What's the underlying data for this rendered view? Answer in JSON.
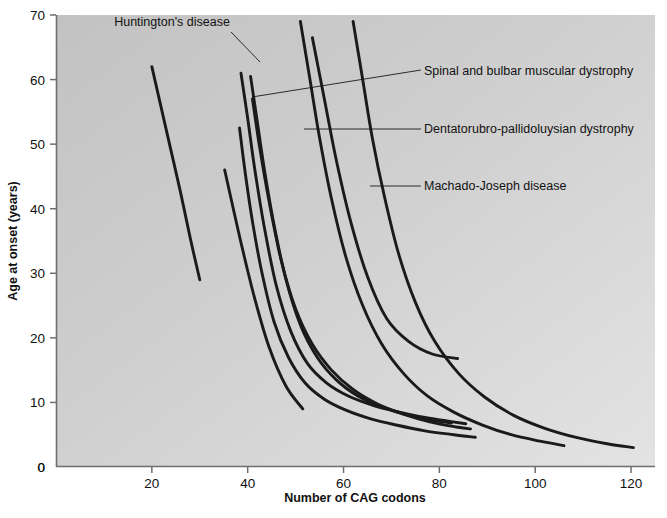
{
  "chart_data": {
    "type": "line",
    "title": "",
    "xlabel": "Number of CAG codons",
    "ylabel": "Age at onset (years)",
    "xlim": [
      0,
      125
    ],
    "ylim": [
      0,
      70
    ],
    "xticks": [
      20,
      40,
      60,
      80,
      100,
      120
    ],
    "yticks": [
      0,
      10,
      20,
      30,
      40,
      50,
      60,
      70
    ],
    "x_origin_label": "0",
    "grid": false,
    "legend_position": "annotations-inline",
    "background": "#c8c8c8",
    "line_color": "#1a1a1a",
    "annotations": [
      {
        "label": "Huntington's disease",
        "label_x": 172,
        "label_y": 26,
        "leader": [
          [
            231,
            32
          ],
          [
            260,
            62
          ]
        ]
      },
      {
        "label": "Spinal and bulbar muscular dystrophy",
        "label_x": 424,
        "label_y": 75,
        "leader": [
          [
            421,
            70
          ],
          [
            252,
            97
          ]
        ]
      },
      {
        "label": "Dentatorubro-pallidoluysian dystrophy",
        "label_x": 424,
        "label_y": 133,
        "leader": [
          [
            421,
            129
          ],
          [
            304,
            129
          ]
        ]
      },
      {
        "label": "Machado-Joseph disease",
        "label_x": 424,
        "label_y": 190,
        "leader": [
          [
            421,
            186
          ],
          [
            370,
            186
          ]
        ]
      }
    ],
    "series": [
      {
        "name": "curve-1",
        "points": [
          [
            20.0,
            62.0
          ],
          [
            22.0,
            55.5
          ],
          [
            24.0,
            49.0
          ],
          [
            26.0,
            42.5
          ],
          [
            28.0,
            35.5
          ],
          [
            30.0,
            29.0
          ]
        ]
      },
      {
        "name": "curve-2",
        "points": [
          [
            35.2,
            46.0
          ],
          [
            37.0,
            40.0
          ],
          [
            39.0,
            33.5
          ],
          [
            41.5,
            26.0
          ],
          [
            44.5,
            18.5
          ],
          [
            48.0,
            12.5
          ],
          [
            51.5,
            9.0
          ]
        ]
      },
      {
        "name": "curve-3",
        "points": [
          [
            38.6,
            61.0
          ],
          [
            40.0,
            54.0
          ],
          [
            41.5,
            46.0
          ],
          [
            43.5,
            37.0
          ],
          [
            46.0,
            28.0
          ],
          [
            49.0,
            21.0
          ],
          [
            52.5,
            16.0
          ],
          [
            56.5,
            13.0
          ],
          [
            61.0,
            11.0
          ],
          [
            66.0,
            9.6
          ],
          [
            71.0,
            8.6
          ],
          [
            76.0,
            7.8
          ],
          [
            81.0,
            7.2
          ],
          [
            85.5,
            6.7
          ]
        ]
      },
      {
        "name": "curve-4",
        "points": [
          [
            38.3,
            52.5
          ],
          [
            39.5,
            45.5
          ],
          [
            41.0,
            38.0
          ],
          [
            43.0,
            30.0
          ],
          [
            45.5,
            22.5
          ],
          [
            48.5,
            17.0
          ],
          [
            52.0,
            13.0
          ],
          [
            56.0,
            10.5
          ],
          [
            60.5,
            8.8
          ],
          [
            65.5,
            7.5
          ],
          [
            71.0,
            6.5
          ],
          [
            77.0,
            5.6
          ],
          [
            83.0,
            5.0
          ],
          [
            87.5,
            4.6
          ]
        ]
      },
      {
        "name": "curve-5",
        "points": [
          [
            40.6,
            60.5
          ],
          [
            42.0,
            53.5
          ],
          [
            43.5,
            46.0
          ],
          [
            45.5,
            37.5
          ],
          [
            48.0,
            29.0
          ],
          [
            51.0,
            22.0
          ],
          [
            54.5,
            17.0
          ],
          [
            58.5,
            13.5
          ],
          [
            63.0,
            11.0
          ],
          [
            68.0,
            9.3
          ],
          [
            73.5,
            8.0
          ],
          [
            79.0,
            7.2
          ],
          [
            82.5,
            6.8
          ]
        ]
      },
      {
        "name": "curve-6",
        "points": [
          [
            41.0,
            57.0
          ],
          [
            42.5,
            49.5
          ],
          [
            44.5,
            41.0
          ],
          [
            47.0,
            32.0
          ],
          [
            50.0,
            24.5
          ],
          [
            53.5,
            19.0
          ],
          [
            57.5,
            15.0
          ],
          [
            62.0,
            12.0
          ],
          [
            67.0,
            9.8
          ],
          [
            72.5,
            8.2
          ],
          [
            78.0,
            7.0
          ],
          [
            83.5,
            6.2
          ],
          [
            86.5,
            5.9
          ]
        ]
      },
      {
        "name": "curve-7",
        "points": [
          [
            51.0,
            69.0
          ],
          [
            53.0,
            60.0
          ],
          [
            55.0,
            51.0
          ],
          [
            57.5,
            41.5
          ],
          [
            60.5,
            32.5
          ],
          [
            64.0,
            25.0
          ],
          [
            68.0,
            19.0
          ],
          [
            72.5,
            14.5
          ],
          [
            77.5,
            11.0
          ],
          [
            83.0,
            8.5
          ],
          [
            89.0,
            6.5
          ],
          [
            95.0,
            5.0
          ],
          [
            101.0,
            4.0
          ],
          [
            106.0,
            3.3
          ]
        ]
      },
      {
        "name": "curve-8",
        "points": [
          [
            62.0,
            69.0
          ],
          [
            64.0,
            60.0
          ],
          [
            66.0,
            51.0
          ],
          [
            68.5,
            42.0
          ],
          [
            71.5,
            33.0
          ],
          [
            75.0,
            25.5
          ],
          [
            79.0,
            19.5
          ],
          [
            84.0,
            14.5
          ],
          [
            89.5,
            10.8
          ],
          [
            95.5,
            8.0
          ],
          [
            102.0,
            6.0
          ],
          [
            109.0,
            4.5
          ],
          [
            115.0,
            3.6
          ],
          [
            120.5,
            3.0
          ]
        ]
      },
      {
        "name": "curve-9",
        "points": [
          [
            53.5,
            66.5
          ],
          [
            56.0,
            57.0
          ],
          [
            58.5,
            47.5
          ],
          [
            61.5,
            38.0
          ],
          [
            65.0,
            29.5
          ],
          [
            69.0,
            23.0
          ],
          [
            73.5,
            19.5
          ],
          [
            78.5,
            17.5
          ],
          [
            83.8,
            16.8
          ]
        ]
      }
    ]
  }
}
